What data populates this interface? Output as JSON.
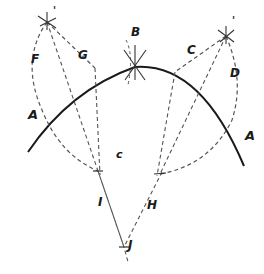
{
  "diagram": {
    "title": "",
    "type": "geometric-construction",
    "colors": {
      "ink": "#1a1a1a",
      "dashed": "#555555",
      "background": "#ffffff"
    },
    "labels": [
      {
        "id": "A-left",
        "text": "A",
        "x": 36,
        "y": 119
      },
      {
        "id": "A-right",
        "text": "A",
        "x": 250,
        "y": 137
      },
      {
        "id": "B",
        "text": "B",
        "x": 134,
        "y": 38
      },
      {
        "id": "C",
        "text": "C",
        "x": 186,
        "y": 55
      },
      {
        "id": "D",
        "text": "D",
        "x": 233,
        "y": 75
      },
      {
        "id": "F",
        "text": "F",
        "x": 33,
        "y": 63
      },
      {
        "id": "G",
        "text": "G",
        "x": 78,
        "y": 57
      },
      {
        "id": "c",
        "text": "c",
        "x": 115,
        "y": 157
      },
      {
        "id": "I",
        "text": "I",
        "x": 98,
        "y": 207
      },
      {
        "id": "H",
        "text": "H",
        "x": 148,
        "y": 209
      },
      {
        "id": "J",
        "text": "J",
        "x": 128,
        "y": 250
      },
      {
        "id": "E-top-left",
        "text": "'",
        "x": 53,
        "y": 14
      },
      {
        "id": "K-top-right",
        "text": "'",
        "x": 232,
        "y": 23
      }
    ],
    "points": {
      "star_left": [
        47,
        22
      ],
      "star_right": [
        226,
        36
      ],
      "arc_peak": [
        135,
        67
      ],
      "arc_left_end": [
        28,
        152
      ],
      "arc_right_end": [
        244,
        166
      ],
      "I_point": [
        98,
        171
      ],
      "H_point": [
        160,
        174
      ],
      "J_point": [
        124,
        247
      ]
    }
  }
}
